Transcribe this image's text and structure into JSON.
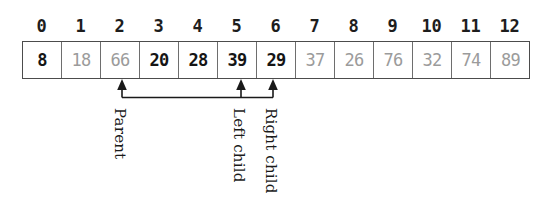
{
  "figure": {
    "kind": "array-heap-indexing-diagram",
    "index_header_label": "array index",
    "indices": [
      "0",
      "1",
      "2",
      "3",
      "4",
      "5",
      "6",
      "7",
      "8",
      "9",
      "10",
      "11",
      "12"
    ],
    "cells": [
      {
        "index": "0",
        "value": "8",
        "emphasis": "dark"
      },
      {
        "index": "1",
        "value": "18",
        "emphasis": "faded"
      },
      {
        "index": "2",
        "value": "66",
        "emphasis": "faded"
      },
      {
        "index": "3",
        "value": "20",
        "emphasis": "dark"
      },
      {
        "index": "4",
        "value": "28",
        "emphasis": "dark"
      },
      {
        "index": "5",
        "value": "39",
        "emphasis": "dark"
      },
      {
        "index": "6",
        "value": "29",
        "emphasis": "dark"
      },
      {
        "index": "7",
        "value": "37",
        "emphasis": "faded"
      },
      {
        "index": "8",
        "value": "26",
        "emphasis": "faded"
      },
      {
        "index": "9",
        "value": "76",
        "emphasis": "faded"
      },
      {
        "index": "10",
        "value": "32",
        "emphasis": "faded"
      },
      {
        "index": "11",
        "value": "74",
        "emphasis": "faded"
      },
      {
        "index": "12",
        "value": "89",
        "emphasis": "faded"
      }
    ],
    "annotations": [
      {
        "label": "Parent",
        "target_index": "2"
      },
      {
        "label": "Left child",
        "target_index": "5"
      },
      {
        "label": "Right child",
        "target_index": "6"
      }
    ],
    "colors": {
      "dark_text": "#151515",
      "faded_text": "#9b9b9b",
      "box_border": "#4c4c4c",
      "cell_divider": "#6e6e6e",
      "arrow": "#1a1a1a",
      "background": "#ffffff"
    }
  }
}
